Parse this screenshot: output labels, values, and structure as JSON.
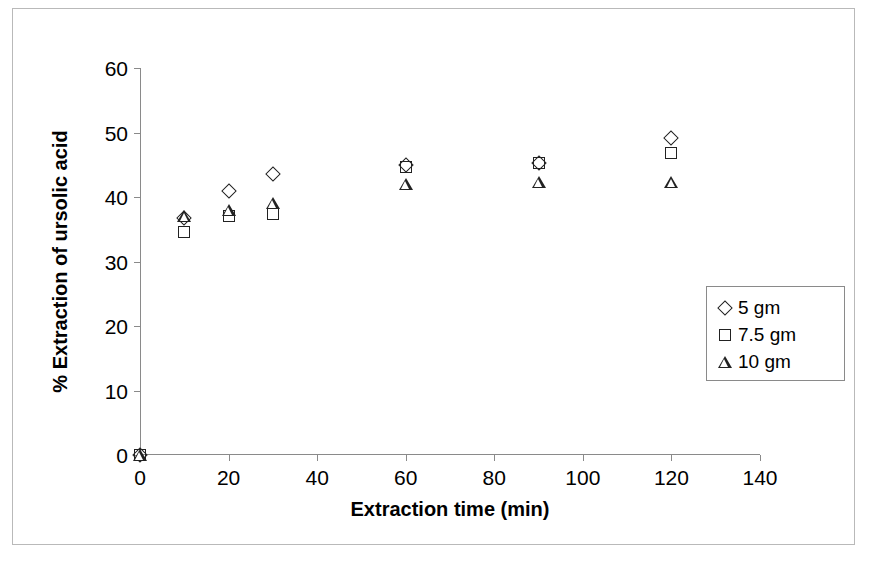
{
  "chart_data": {
    "type": "scatter",
    "title": "",
    "xlabel": "Extraction time (min)",
    "ylabel": "% Extraction of ursolic acid",
    "xlim": [
      0,
      140
    ],
    "ylim": [
      0,
      60
    ],
    "xticks": [
      0,
      20,
      40,
      60,
      80,
      100,
      120,
      140
    ],
    "yticks": [
      0,
      10,
      20,
      30,
      40,
      50,
      60
    ],
    "grid": false,
    "legend_position": "inside-right",
    "x": [
      0,
      10,
      20,
      30,
      60,
      90,
      120
    ],
    "series": [
      {
        "name": "5 gm",
        "marker": "diamond",
        "values": [
          0,
          36.8,
          41.0,
          43.5,
          44.9,
          45.3,
          49.1
        ]
      },
      {
        "name": "7.5 gm",
        "marker": "square",
        "values": [
          0,
          34.5,
          37.0,
          37.3,
          44.7,
          45.2,
          46.8
        ]
      },
      {
        "name": "10 gm",
        "marker": "triangle",
        "values": [
          0,
          37.0,
          38.0,
          39.0,
          42.0,
          42.3,
          42.4
        ]
      }
    ]
  },
  "axes": {
    "x_title": "Extraction time (min)",
    "y_title": "% Extraction of ursolic acid",
    "x_tick_labels": [
      "0",
      "20",
      "40",
      "60",
      "80",
      "100",
      "120",
      "140"
    ],
    "y_tick_labels": [
      "0",
      "10",
      "20",
      "30",
      "40",
      "50",
      "60"
    ]
  },
  "legend": {
    "entries": [
      {
        "label": "5 gm",
        "marker": "diamond"
      },
      {
        "label": "7.5 gm",
        "marker": "square"
      },
      {
        "label": "10 gm",
        "marker": "triangle"
      }
    ]
  },
  "colors": {
    "marker": "#222222",
    "axis": "#8a8a8a",
    "frame": "#b9b9b9",
    "background": "#ffffff"
  }
}
